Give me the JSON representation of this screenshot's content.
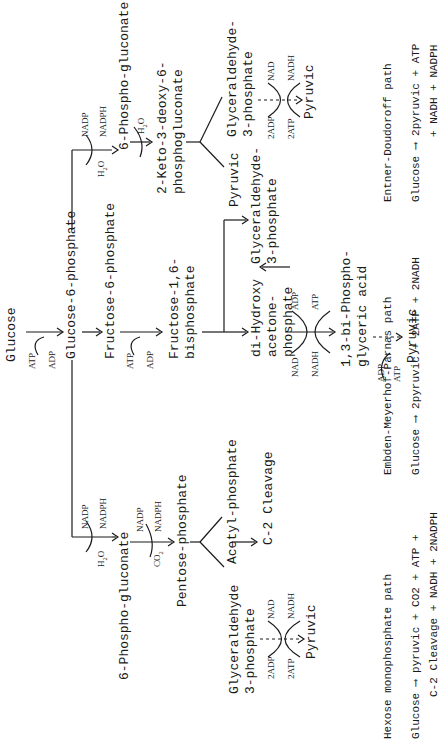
{
  "main_chain": {
    "glucose": "Glucose",
    "g6p": "Glucose-6-phosphate",
    "f6p": "Fructose-6-phosphate",
    "fbp_line1": "Fructose-1,6-",
    "fbp_line2": "bisphosphate",
    "atp1": "ATP",
    "adp1": "ADP",
    "atp2": "ATP",
    "adp2": "ADP"
  },
  "emp": {
    "dhap_line1": "di-Hydroxy",
    "dhap_line2": "acetone-",
    "dhap_line3": "phosphate",
    "g3p_line1": "Glyceraldehyde-",
    "g3p_line2": "3-phosphate",
    "nad": "NAD",
    "nadh": "NADH",
    "adp": "ADP",
    "atp": "ATP",
    "bpg_line1": "1,3-bi-Phospho-",
    "bpg_line2": "glyceric acid",
    "adp2": "ADP",
    "atp2": "ATP",
    "pyruvic": "Pyruvic",
    "title": "Embden-Meyerhof-Parnas path",
    "equation": "Glucose ⟶ 2pyruvic + 2ATP + 2NADH"
  },
  "hmp": {
    "h2o": "H2O",
    "nadp": "NADP",
    "nadph": "NADPH",
    "pgluc": "6-Phospho-gluconate",
    "co2": "CO2",
    "nadp2": "NADP",
    "nadph2": "NADPH",
    "pentose": "Pentose-phosphate",
    "g3p_line1": "Glyceraldehyde",
    "g3p_line2": "3-phosphate",
    "acetyl": "Acetyl-phosphate",
    "c2": "C-2  Cleavage",
    "adp": "2ADP",
    "atp": "2ATP",
    "nad": "NAD",
    "nadh": "NADH",
    "pyruvic": "Pyruvic",
    "title": "Hexose monophosphate path",
    "equation_line1": "Glucose ⟶ pyruvic + CO2 + ATP +",
    "equation_line2": "C-2 Cleavage + NADH + 2NADPH"
  },
  "ed": {
    "h2o": "H2O",
    "nadp": "NADP",
    "nadph": "NADPH",
    "pgluc": "6-Phospho-gluconate",
    "h2o2": "H2O",
    "kdpg_line1": "2-Keto-3-deoxy-6-",
    "kdpg_line2": "phosphogluconate",
    "pyruvic1": "Pyruvic",
    "g3p_line1": "Glyceraldehyde-",
    "g3p_line2": "3-phosphate",
    "adp": "2ADP",
    "atp": "2ATP",
    "nad": "NAD",
    "nadh": "NADH",
    "pyruvic2": "Pyruvic",
    "title": "Entner-Doudoroff path",
    "equation_line1": "Glucose ⟶ 2pyruvic + ATP",
    "equation_line2": "+ NADH + NADPH"
  }
}
